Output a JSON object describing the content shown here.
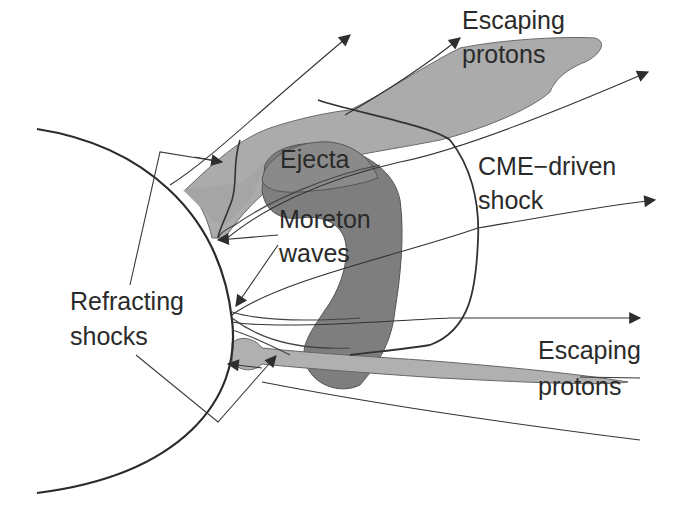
{
  "diagram": {
    "type": "schematic",
    "colors": {
      "background": "#ffffff",
      "line": "#333333",
      "light_fill": "#a8a8a8",
      "dark_fill": "#7c7c7c",
      "text": "#2a2a2a"
    },
    "labels": {
      "escaping_protons_top_line1": "Escaping",
      "escaping_protons_top_line2": "protons",
      "ejecta": "Ejecta",
      "cme_shock_line1": "CME−driven",
      "cme_shock_line2": "shock",
      "moreton_line1": "Moreton",
      "moreton_line2": "waves",
      "refracting_line1": "Refracting",
      "refracting_line2": "shocks",
      "escaping_protons_bottom_line1": "Escaping",
      "escaping_protons_bottom_line2": "protons"
    },
    "regions": [
      {
        "name": "sun-limb",
        "shape": "circle arc"
      },
      {
        "name": "escaping-protons-upper",
        "fill": "light_fill"
      },
      {
        "name": "ejecta",
        "fill": "dark_fill"
      },
      {
        "name": "escaping-protons-lower",
        "fill": "light_fill"
      },
      {
        "name": "cme-driven-shock-front",
        "shape": "curve"
      }
    ]
  }
}
